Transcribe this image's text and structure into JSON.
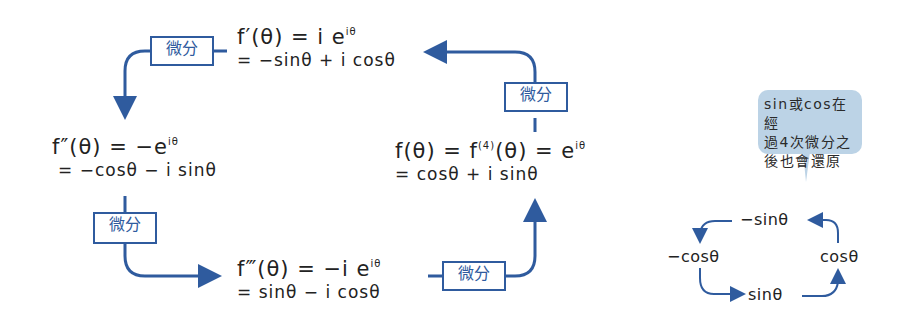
{
  "diagram": {
    "accent_color": "#2f5b9e",
    "bubble_color": "#bcd3e6",
    "nodes": {
      "f1": {
        "line1": "f′(θ) = i e",
        "sup": "iθ",
        "line2": "= −sinθ + i cosθ"
      },
      "f2": {
        "line1": "f″(θ) = −e",
        "sup": "iθ",
        "line2": "= −cosθ − i sinθ"
      },
      "f3": {
        "line1": "f‴(θ) = −i e",
        "sup": "iθ",
        "line2": "= sinθ − i cosθ"
      },
      "f0": {
        "line1a": "f(θ) = f",
        "sup_a": "(4)",
        "line1b": "(θ) = e",
        "sup": "iθ",
        "line2": "= cosθ + i sinθ"
      }
    },
    "edge_label": "微分",
    "edges": [
      {
        "from": "f0",
        "to": "f1",
        "label": "微分"
      },
      {
        "from": "f1",
        "to": "f2",
        "label": "微分"
      },
      {
        "from": "f2",
        "to": "f3",
        "label": "微分"
      },
      {
        "from": "f3",
        "to": "f0",
        "label": "微分"
      }
    ],
    "callout": {
      "text_lines": [
        "sin或cos在經",
        "過4次微分之",
        "後也會還原"
      ]
    },
    "mini_cycle": {
      "top": "−sinθ",
      "left": "−cosθ",
      "bottom": "sinθ",
      "right": "cosθ"
    }
  }
}
